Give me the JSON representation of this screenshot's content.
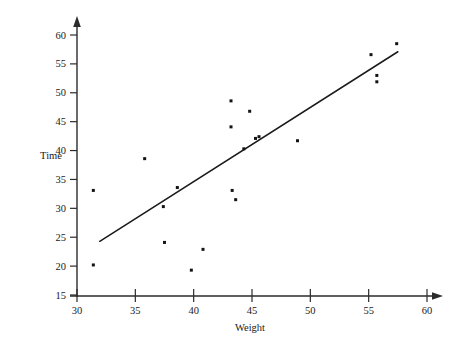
{
  "chart_data": {
    "type": "scatter",
    "title": "",
    "xlabel": "Weight",
    "ylabel": "Time",
    "xlim": [
      30,
      60
    ],
    "ylim": [
      15,
      60
    ],
    "xticks": [
      30,
      35,
      40,
      45,
      50,
      55,
      60
    ],
    "yticks": [
      15,
      20,
      25,
      30,
      35,
      40,
      45,
      50,
      55,
      60
    ],
    "grid": false,
    "legend": null,
    "points": [
      {
        "x": 31.4,
        "y": 33.1
      },
      {
        "x": 31.4,
        "y": 20.2
      },
      {
        "x": 35.8,
        "y": 38.6
      },
      {
        "x": 37.4,
        "y": 30.3
      },
      {
        "x": 37.5,
        "y": 24.1
      },
      {
        "x": 38.6,
        "y": 33.6
      },
      {
        "x": 39.8,
        "y": 19.3
      },
      {
        "x": 40.8,
        "y": 22.9
      },
      {
        "x": 43.2,
        "y": 48.6
      },
      {
        "x": 43.2,
        "y": 44.1
      },
      {
        "x": 43.3,
        "y": 33.1
      },
      {
        "x": 43.6,
        "y": 31.5
      },
      {
        "x": 44.3,
        "y": 40.3
      },
      {
        "x": 44.8,
        "y": 46.8
      },
      {
        "x": 45.3,
        "y": 42.1
      },
      {
        "x": 45.6,
        "y": 42.4
      },
      {
        "x": 48.9,
        "y": 41.7
      },
      {
        "x": 55.2,
        "y": 56.6
      },
      {
        "x": 55.7,
        "y": 53.0
      },
      {
        "x": 55.7,
        "y": 51.9
      },
      {
        "x": 57.4,
        "y": 58.5
      }
    ],
    "fit_line": {
      "label": "regression line",
      "x_start": 31.95,
      "y_start": 24.3,
      "x_end": 57.5,
      "y_end": 57.1
    }
  }
}
